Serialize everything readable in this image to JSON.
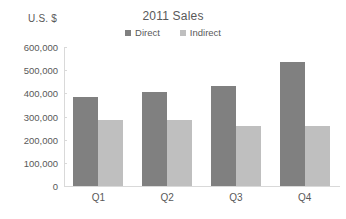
{
  "chart_data": {
    "type": "bar",
    "title": "2011 Sales",
    "xlabel": "",
    "ylabel": "U.S. $",
    "categories": [
      "Q1",
      "Q2",
      "Q3",
      "Q4"
    ],
    "series": [
      {
        "name": "Direct",
        "color": "#808080",
        "values": [
          385000,
          405000,
          432000,
          535000
        ]
      },
      {
        "name": "Indirect",
        "color": "#bfbfbf",
        "values": [
          285000,
          285000,
          260000,
          260000
        ]
      }
    ],
    "ylim": [
      0,
      600000
    ],
    "ytick_values": [
      600000,
      500000,
      400000,
      300000,
      200000,
      100000,
      0
    ],
    "ytick_labels": [
      "600,000",
      "500,000",
      "400,000",
      "300,000",
      "200,000",
      "100,000",
      "0"
    ],
    "grid": false,
    "legend_position": "top-center"
  },
  "axis": {
    "y_title": "U.S. $"
  },
  "colors": {
    "direct": "#808080",
    "indirect": "#bfbfbf",
    "axis": "#d9d9d9",
    "text": "#595959",
    "background": "#ffffff"
  }
}
